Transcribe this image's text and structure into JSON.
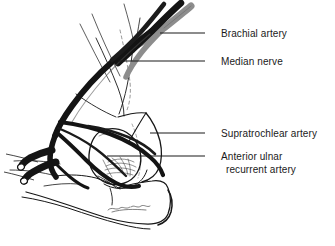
{
  "figure": {
    "view": "anterior cubital fossa, right elbow",
    "background_color": "#ffffff",
    "ink_color": "#111111",
    "nerve_color": "#8a8a8a",
    "artery_color": "#141414"
  },
  "labels": [
    {
      "id": "brachial-artery",
      "text": "Brachial artery",
      "leader_from_x": 205,
      "leader_from_y": 33,
      "leader_to_x": 160,
      "leader_to_y": 33
    },
    {
      "id": "median-nerve",
      "text": "Median nerve",
      "leader_from_x": 205,
      "leader_from_y": 61,
      "leader_to_x": 118,
      "leader_to_y": 61
    },
    {
      "id": "supratrochlear-artery",
      "text": "Supratrochlear artery",
      "leader_from_x": 205,
      "leader_from_y": 133,
      "leader_to_x": 150,
      "leader_to_y": 133
    },
    {
      "id": "anterior-ulnar-recurrent-artery",
      "text_line1": "Anterior ulnar",
      "text_line2": "recurrent artery",
      "leader_from_x": 205,
      "leader_from_y": 156,
      "leader_to_x": 107,
      "leader_to_y": 156
    }
  ],
  "structures": [
    {
      "id": "brachial-artery",
      "kind": "artery",
      "shade": "dark"
    },
    {
      "id": "median-nerve",
      "kind": "nerve",
      "shade": "grey"
    },
    {
      "id": "supratrochlear-artery",
      "kind": "artery",
      "shade": "dark"
    },
    {
      "id": "anterior-ulnar-recurrent-artery",
      "kind": "artery",
      "shade": "dark"
    },
    {
      "id": "humerus-capitulum",
      "kind": "bone",
      "shade": "outline"
    },
    {
      "id": "ulna-forearm",
      "kind": "bone",
      "shade": "outline"
    },
    {
      "id": "bicipital-aponeurosis",
      "kind": "fascia",
      "shade": "outline"
    },
    {
      "id": "cut-vessel-stumps",
      "kind": "artery",
      "shade": "dark"
    }
  ],
  "signature": {
    "present": true,
    "location": "lower-center"
  }
}
